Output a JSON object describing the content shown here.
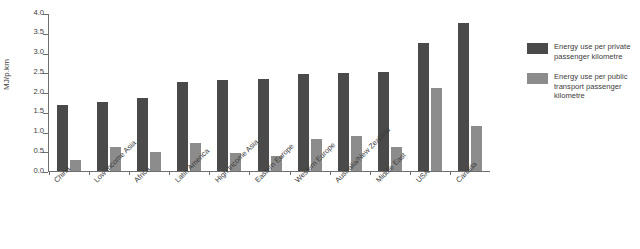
{
  "chart_data": {
    "type": "bar",
    "title": "",
    "xlabel": "",
    "ylabel": "MJ/p.km",
    "ylim": [
      0,
      4.0
    ],
    "ytick_labels": [
      "4.0",
      "3.5",
      "3.0",
      "2.5",
      "2.0",
      "1.5",
      "1.0",
      "0.5",
      "0.0"
    ],
    "ytick_values": [
      4.0,
      3.5,
      3.0,
      2.5,
      2.0,
      1.5,
      1.0,
      0.5,
      0.0
    ],
    "grid": false,
    "legend_position": "right",
    "categories": [
      "China",
      "Low Income Asia",
      "Africa",
      "Latin America",
      "High Income Asia",
      "Eastern Europe",
      "Western Europe",
      "Australia/New Zealand",
      "Middle East",
      "USA",
      "Canada"
    ],
    "series": [
      {
        "name": "Energy use per private passenger kilometre",
        "color": "#4a4a4a",
        "values": [
          1.68,
          1.75,
          1.85,
          2.25,
          2.3,
          2.32,
          2.45,
          2.48,
          2.5,
          3.25,
          3.75
        ]
      },
      {
        "name": "Energy use per public transport passenger kilometre",
        "color": "#8c8c8c",
        "values": [
          0.27,
          0.6,
          0.48,
          0.72,
          0.45,
          0.37,
          0.8,
          0.88,
          0.6,
          2.1,
          1.15
        ]
      }
    ]
  },
  "legend": {
    "items": [
      {
        "label": "Energy use per private passenger kilometre",
        "color": "#4a4a4a"
      },
      {
        "label": "Energy use per public transport passenger kilometre",
        "color": "#8c8c8c"
      }
    ]
  },
  "caption": {
    "text": ""
  }
}
